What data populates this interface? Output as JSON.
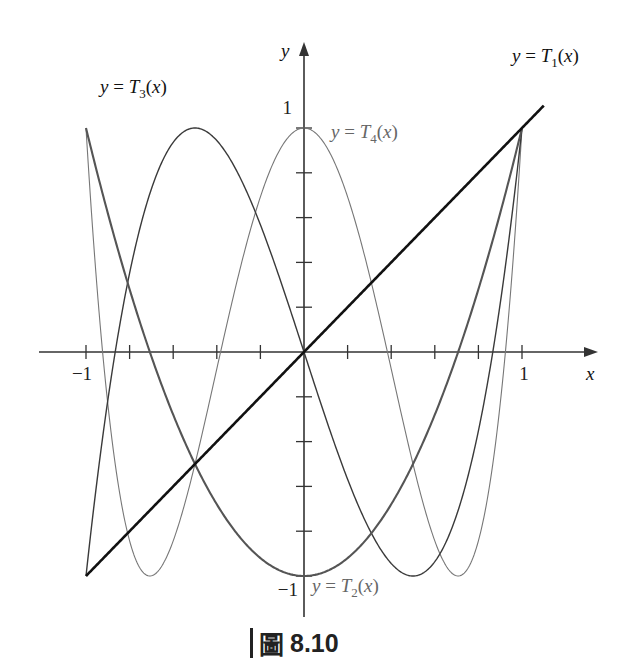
{
  "chart_data": {
    "type": "line",
    "title": "",
    "caption": {
      "prefix": "圖",
      "number": "8.10"
    },
    "xlabel": "x",
    "ylabel": "y",
    "xlim": [
      -1,
      1
    ],
    "ylim": [
      -1,
      1
    ],
    "grid": false,
    "x_ticks": [
      -1,
      -0.8,
      -0.6,
      -0.4,
      -0.2,
      0,
      0.2,
      0.4,
      0.6,
      0.8,
      1
    ],
    "y_ticks": [
      -1,
      -0.8,
      -0.6,
      -0.4,
      -0.2,
      0,
      0.2,
      0.4,
      0.6,
      0.8,
      1
    ],
    "x_tick_labels": {
      "-1": "−1",
      "1": "1"
    },
    "y_tick_labels": {
      "-1": "−1",
      "1": "1"
    },
    "series": [
      {
        "name": "y = T1(x)",
        "formula": "x",
        "label_text": "y = T",
        "sub": "1",
        "label_tail": "(x)",
        "color": "#111111",
        "width": 2.6,
        "x_range": [
          -1,
          1.1
        ]
      },
      {
        "name": "y = T2(x)",
        "formula": "2x^2 - 1",
        "label_text": "y = T",
        "sub": "2",
        "label_tail": "(x)",
        "color": "#555555",
        "width": 2.1,
        "x_range": [
          -1,
          1
        ]
      },
      {
        "name": "y = T3(x)",
        "formula": "4x^3 - 3x",
        "label_text": "y = T",
        "sub": "3",
        "label_tail": "(x)",
        "color": "#3a3a3a",
        "width": 1.4,
        "x_range": [
          -1,
          1
        ]
      },
      {
        "name": "y = T4(x)",
        "formula": "8x^4 - 8x^2 + 1",
        "label_text": "y = T",
        "sub": "4",
        "label_tail": "(x)",
        "color": "#777777",
        "width": 1.1,
        "x_range": [
          -1,
          1
        ]
      }
    ],
    "annotations": [
      {
        "series": "y = T3(x)",
        "x_px": 100,
        "y_px": 93,
        "grey": false
      },
      {
        "series": "y = T1(x)",
        "x_px": 512,
        "y_px": 62,
        "grey": false
      },
      {
        "series": "y = T4(x)",
        "x_px": 331,
        "y_px": 138,
        "grey": true
      },
      {
        "series": "y = T2(x)",
        "x_px": 312,
        "y_px": 592,
        "grey": true
      }
    ],
    "key_points": {
      "T1": [
        [
          -1,
          -1
        ],
        [
          0,
          0
        ],
        [
          1,
          1
        ]
      ],
      "T2": [
        [
          -1,
          1
        ],
        [
          0,
          -1
        ],
        [
          1,
          1
        ]
      ],
      "T3": [
        [
          -1,
          -1
        ],
        [
          -0.5,
          1
        ],
        [
          0,
          0
        ],
        [
          0.5,
          -1
        ],
        [
          1,
          1
        ]
      ],
      "T4": [
        [
          -1,
          1
        ],
        [
          -0.7071,
          -1
        ],
        [
          0,
          1
        ],
        [
          0.7071,
          -1
        ],
        [
          1,
          1
        ]
      ]
    }
  },
  "layout": {
    "origin_px": [
      304,
      352
    ],
    "x_scale": 218,
    "y_scale": 224,
    "x_axis_px": [
      39,
      598
    ],
    "y_axis_px": [
      617,
      42
    ]
  }
}
